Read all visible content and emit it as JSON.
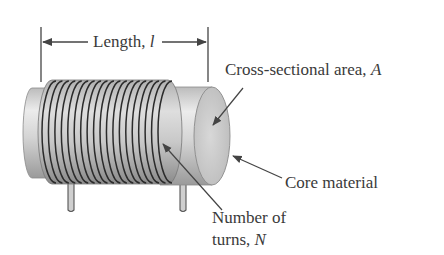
{
  "diagram": {
    "length_label": {
      "text": "Length, ",
      "symbol": "l"
    },
    "area_label": {
      "text": "Cross-sectional area, ",
      "symbol": "A"
    },
    "core_label": {
      "text": "Core material"
    },
    "turns_label": {
      "line1": "Number of",
      "line2_text": "turns, ",
      "symbol": "N"
    },
    "coil_turns": 19,
    "colors": {
      "text": "#3a3a3a",
      "wire": "#2b2b2b",
      "core_light": "#e6e6e6",
      "core_mid": "#bdbdbd",
      "core_dark": "#8e8e8e",
      "arrow": "#444444"
    }
  }
}
